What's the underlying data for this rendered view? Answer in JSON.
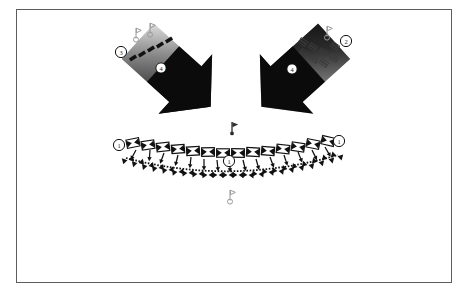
{
  "figure": {
    "background_color": "#ffffff",
    "frame_color": "#5d5d5d",
    "ink_color": "#111111",
    "caption": "",
    "callouts": [
      {
        "id": "callout-left-band-end",
        "label": "1",
        "x": 119,
        "y": 145,
        "style": "circle-outline"
      },
      {
        "id": "callout-right-band-end",
        "label": "1",
        "x": 339,
        "y": 141,
        "style": "circle-outline"
      },
      {
        "id": "callout-center-band",
        "label": "1",
        "x": 229,
        "y": 161,
        "style": "circle-outline"
      },
      {
        "id": "callout-left-small-marks",
        "label": "3",
        "x": 121,
        "y": 52,
        "style": "circle-outline"
      },
      {
        "id": "callout-right-small-marks",
        "label": "2",
        "x": 346,
        "y": 41,
        "style": "circle-outline"
      },
      {
        "id": "callout-left-arrow",
        "label": "4",
        "x": 161,
        "y": 68,
        "style": "circle-on-dark"
      },
      {
        "id": "callout-right-arrow",
        "label": "4",
        "x": 292,
        "y": 69,
        "style": "circle-on-dark"
      }
    ],
    "arrows": [
      {
        "id": "arrow-left",
        "label": "4",
        "angle": 42,
        "tip_x": 196,
        "tip_y": 108
      },
      {
        "id": "arrow-right",
        "label": "4",
        "angle": 138,
        "tip_x": 274,
        "tip_y": 110
      }
    ],
    "flags": [
      {
        "id": "flag-upper-center",
        "x": 233,
        "y": 124,
        "fill": "solid"
      },
      {
        "id": "flag-lower-center",
        "x": 231,
        "y": 192,
        "fill": "hollow"
      },
      {
        "id": "flag-left-a",
        "x": 138,
        "y": 30,
        "fill": "hollow"
      },
      {
        "id": "flag-left-b",
        "x": 150,
        "y": 25,
        "fill": "hollow"
      },
      {
        "id": "flag-right-a",
        "x": 327,
        "y": 28,
        "fill": "hollow"
      }
    ],
    "band": {
      "id": "curved-band",
      "left_x": 125,
      "right_x": 337,
      "top_y": 140,
      "sag": 18,
      "upper_marker_count": 14,
      "lower_marker_count": 22,
      "upper_marker_shape": "bowtie",
      "lower_marker_shape": "triangle-pair",
      "connector_shape": "down-arrow"
    },
    "small_marks": {
      "left_group": {
        "id": "small-marks-left",
        "count": 5,
        "shape": "filled-bar",
        "angle": -32
      },
      "right_group": {
        "id": "small-marks-right",
        "count": 8,
        "shape": "hollow-double-bar",
        "angle": 32
      }
    }
  }
}
